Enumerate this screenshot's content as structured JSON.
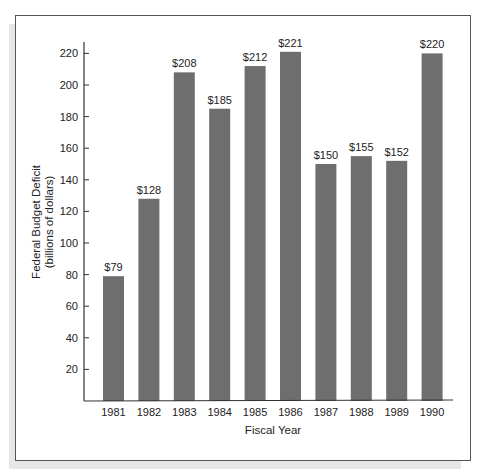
{
  "chart_data": {
    "type": "bar",
    "title": "",
    "xlabel": "Fiscal Year",
    "ylabel": "Federal Budget Deficit",
    "ylabel_sub": "(billions of dollars)",
    "categories": [
      "1981",
      "1982",
      "1983",
      "1984",
      "1985",
      "1986",
      "1987",
      "1988",
      "1989",
      "1990"
    ],
    "values": [
      79,
      128,
      208,
      185,
      212,
      221,
      150,
      155,
      152,
      220
    ],
    "data_labels": [
      "$79",
      "$128",
      "$208",
      "$185",
      "$212",
      "$221",
      "$150",
      "$155",
      "$152",
      "$220"
    ],
    "yticks": [
      20,
      40,
      60,
      80,
      100,
      120,
      140,
      160,
      180,
      200,
      220
    ],
    "ylim": [
      0,
      230
    ],
    "grid": false,
    "legend": null,
    "bar_color": "#6e6e6e"
  }
}
